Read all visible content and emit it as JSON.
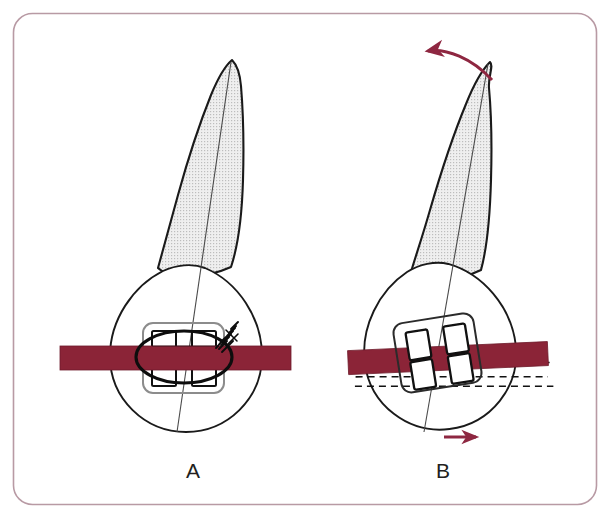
{
  "figure": {
    "background_color": "#ffffff",
    "border_color": "#b89aa4",
    "border_radius_px": 18
  },
  "colors": {
    "archwire": "#8b2437",
    "archwire_edge": "#6e1b2b",
    "arrow": "#8e2741",
    "outline": "#1a1a1a",
    "root_fill": "#ededed",
    "root_stipple": "#b9b9b9",
    "bracket_body": "#8c8c8c",
    "bracket_wing_fill": "#ffffff",
    "axis_line": "#4a4a4a",
    "dashed_line": "#111111",
    "label_text": "#231f20",
    "ligature": "#0d0d0d"
  },
  "panels": [
    {
      "id": "A",
      "label": "A",
      "label_x": 193,
      "label_y": 478,
      "caption_state": "rotated tooth with elastic ligature engaged on bracket",
      "tooth": {
        "long_axis_tilt_deg": 4,
        "root_tip_x": 232,
        "root_tip_y": 60,
        "crown_center_x": 183,
        "crown_center_y": 345,
        "crown_rotation_deg": 0
      },
      "bracket": {
        "rotation_deg": 0,
        "center_x": 183,
        "center_y": 357,
        "wings": 4
      },
      "archwire": {
        "x_start": 60,
        "x_end": 291,
        "y_center": 358,
        "thickness": 24,
        "tilt_deg": 0
      },
      "ligature": {
        "present": true,
        "type": "elastic-module-with-twisted-tail",
        "center_x": 183,
        "center_y": 357
      },
      "dashed_guides": false,
      "arrows": []
    },
    {
      "id": "B",
      "label": "B",
      "label_x": 443,
      "label_y": 478,
      "caption_state": "tooth derotating, bracket tipped relative to archwire",
      "tooth": {
        "long_axis_tilt_deg": 9,
        "root_tip_x": 490,
        "root_tip_y": 62,
        "crown_center_x": 437,
        "crown_center_y": 345,
        "crown_rotation_deg": -8
      },
      "bracket": {
        "rotation_deg": -9,
        "center_x": 437,
        "center_y": 353,
        "wings": 4
      },
      "archwire": {
        "x_start": 352,
        "x_end": 545,
        "y_center": 358,
        "thickness": 24,
        "tilt_deg": -2.5
      },
      "ligature": {
        "present": false,
        "type": "none"
      },
      "dashed_guides": true,
      "dashed_guide_tilt_deg": -9,
      "arrows": [
        {
          "name": "crown-derotation-arrow-top",
          "style": "curved",
          "direction": "left",
          "from_x": 490,
          "from_y": 78,
          "to_x": 424,
          "to_y": 52
        },
        {
          "name": "crown-derotation-arrow-bottom",
          "style": "straight",
          "direction": "right",
          "from_x": 444,
          "from_y": 437,
          "to_x": 478,
          "to_y": 437
        }
      ]
    }
  ]
}
